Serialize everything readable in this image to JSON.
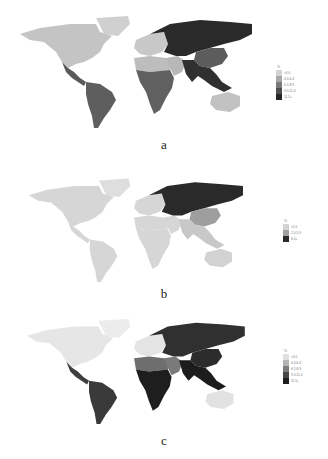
{
  "panels": [
    {
      "id": "a",
      "caption": "a",
      "legend": {
        "unit": "%",
        "items": [
          {
            "label": "<4.0",
            "color": "#d2d2d2"
          },
          {
            "label": "4.0-6.4",
            "color": "#a8a8a8"
          },
          {
            "label": "6.5-8.9",
            "color": "#7a7a7a"
          },
          {
            "label": "9.0-11.4",
            "color": "#505050"
          },
          {
            "label": "11.5+",
            "color": "#262626"
          }
        ]
      },
      "regions": {
        "north_america": "#c4c4c4",
        "central_america": "#5a5a5a",
        "south_america": "#5e5e5e",
        "europe": "#c8c8c8",
        "north_africa": "#bdbdbd",
        "sub_saharan_africa": "#606060",
        "russia_central_asia": "#2a2a2a",
        "china": "#5c5c5c",
        "south_southeast_asia": "#303030",
        "middle_east": "#b8b8b8",
        "australia": "#c2c2c2",
        "greenland": "#d0d0d0"
      }
    },
    {
      "id": "b",
      "caption": "b",
      "legend": {
        "unit": "%",
        "items": [
          {
            "label": "<2.0",
            "color": "#d4d4d4"
          },
          {
            "label": "2.0-5.9",
            "color": "#a0a0a0"
          },
          {
            "label": "6.0+",
            "color": "#2a2a2a"
          }
        ]
      },
      "regions": {
        "north_america": "#d6d6d6",
        "central_america": "#d6d6d6",
        "south_america": "#d6d6d6",
        "europe": "#d6d6d6",
        "north_africa": "#d6d6d6",
        "sub_saharan_africa": "#d6d6d6",
        "russia_central_asia": "#2a2a2a",
        "china": "#9e9e9e",
        "south_southeast_asia": "#c8c8c8",
        "middle_east": "#d6d6d6",
        "australia": "#d2d2d2",
        "greenland": "#dedede"
      }
    },
    {
      "id": "c",
      "caption": "c",
      "legend": {
        "unit": "%",
        "items": [
          {
            "label": "<4.0",
            "color": "#e0e0e0"
          },
          {
            "label": "4.0-6.4",
            "color": "#b4b4b4"
          },
          {
            "label": "6.5-8.9",
            "color": "#7c7c7c"
          },
          {
            "label": "9.0-11.4",
            "color": "#464646"
          },
          {
            "label": "11.5+",
            "color": "#1e1e1e"
          }
        ]
      },
      "regions": {
        "north_america": "#e6e6e6",
        "central_america": "#3e3e3e",
        "south_america": "#3a3a3a",
        "europe": "#e4e4e4",
        "north_africa": "#6e6e6e",
        "sub_saharan_africa": "#1e1e1e",
        "russia_central_asia": "#303030",
        "china": "#2c2c2c",
        "south_southeast_asia": "#1c1c1c",
        "middle_east": "#7a7a7a",
        "australia": "#e2e2e2",
        "greenland": "#ececec"
      }
    }
  ]
}
